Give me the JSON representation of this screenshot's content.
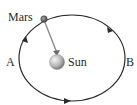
{
  "diagram": {
    "labels": {
      "planet": "Mars",
      "star": "Sun",
      "point_a": "A",
      "point_b": "B"
    },
    "orbit_direction": "counterclockwise",
    "colors": {
      "orbit": "#2b2b2b",
      "radius_line": "#8a8a8a",
      "planet": "#6e6e6e",
      "sun_light": "#f2f2f2",
      "sun_dark": "#7a7a7a",
      "text": "#2a2a2a"
    }
  }
}
